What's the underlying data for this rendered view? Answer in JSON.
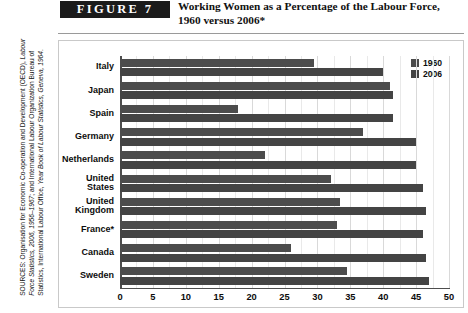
{
  "header": {
    "figure_label": "FIGURE  7",
    "title_line1": "Working Women as a Percentage of the Labour Force,",
    "title_line2": "1960 versus 2006*"
  },
  "sources": {
    "prefix": "SOURCES: Organisation for Economic Co-operation and Development (OECD), ",
    "italic1": "Labour Force Statistics, 2006, 1956–1967",
    "mid": "; and International Labour Organization Bureau of Statistics, International Labour Office, ",
    "italic2": "Year Book of Labour Statistics, Geneva, 1964",
    "suffix": "."
  },
  "chart_data": {
    "type": "bar",
    "orientation": "horizontal",
    "title": "Working Women as a Percentage of the Labour Force, 1960 versus 2006*",
    "xlabel": "",
    "ylabel": "",
    "xlim": [
      0,
      50
    ],
    "xticks": [
      0,
      5,
      10,
      15,
      20,
      25,
      30,
      35,
      40,
      45,
      50
    ],
    "grid": true,
    "legend_position": "top-right",
    "categories": [
      "Italy",
      "Japan",
      "Spain",
      "Germany",
      "Netherlands",
      "United States",
      "United Kingdom",
      "France*",
      "Canada",
      "Sweden"
    ],
    "category_labels": [
      [
        "Italy"
      ],
      [
        "Japan"
      ],
      [
        "Spain"
      ],
      [
        "Germany"
      ],
      [
        "Netherlands"
      ],
      [
        "United",
        "States"
      ],
      [
        "United",
        "Kingdom"
      ],
      [
        "France*"
      ],
      [
        "Canada"
      ],
      [
        "Sweden"
      ]
    ],
    "series": [
      {
        "name": "1960",
        "color": "#4c4c4c",
        "values": [
          29.5,
          41.0,
          18.0,
          37.0,
          22.0,
          32.0,
          33.5,
          33.0,
          26.0,
          34.5
        ]
      },
      {
        "name": "2006",
        "color": "#444444",
        "values": [
          40.0,
          41.5,
          41.5,
          45.0,
          45.0,
          46.0,
          46.5,
          46.0,
          46.5,
          47.0
        ]
      }
    ]
  }
}
